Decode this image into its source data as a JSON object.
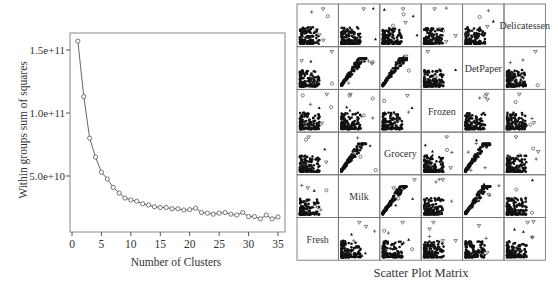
{
  "chart_data": [
    {
      "type": "line",
      "title": "",
      "xlabel": "Number of Clusters",
      "ylabel": "Within groups sum of squares",
      "xlim": [
        0,
        35
      ],
      "ylim": [
        12000000000.0,
        160000000000.0
      ],
      "x_ticks": [
        0,
        5,
        10,
        15,
        20,
        25,
        30,
        35
      ],
      "x_tick_labels": [
        "0",
        "5",
        "10",
        "15",
        "20",
        "25",
        "30",
        "35"
      ],
      "y_ticks": [
        50000000000.0,
        100000000000.0,
        150000000000.0
      ],
      "y_tick_labels": [
        "5.0e+10",
        "1.0e+11",
        "1.5e+11"
      ],
      "grid": false,
      "marker": "open-circle",
      "x": [
        1,
        2,
        3,
        4,
        5,
        6,
        7,
        8,
        9,
        10,
        11,
        12,
        13,
        14,
        15,
        16,
        17,
        18,
        19,
        20,
        21,
        22,
        23,
        24,
        25,
        26,
        27,
        28,
        29,
        30,
        31,
        32,
        33,
        34,
        35
      ],
      "y": [
        157000000000.0,
        113000000000.0,
        80000000000.0,
        65000000000.0,
        53000000000.0,
        47600000000.0,
        41000000000.0,
        36500000000.0,
        32500000000.0,
        31000000000.0,
        30000000000.0,
        27900000000.0,
        27000000000.0,
        25600000000.0,
        25000000000.0,
        25000000000.0,
        24000000000.0,
        24000000000.0,
        23000000000.0,
        23300000000.0,
        24500000000.0,
        21000000000.0,
        20500000000.0,
        19700000000.0,
        20500000000.0,
        21000000000.0,
        19700000000.0,
        19000000000.0,
        21000000000.0,
        17800000000.0,
        17800000000.0,
        16000000000.0,
        19000000000.0,
        16000000000.0,
        17500000000.0
      ]
    },
    {
      "type": "scatter",
      "title": "Scatter Plot Matrix",
      "variables_top_to_bottom": [
        "Delicatessen",
        "DetPaper",
        "Frozen",
        "Grocery",
        "Milk",
        "Fresh"
      ],
      "diagonal_labels": [
        "Fresh",
        "Milk",
        "Grocery",
        "Frozen",
        "DetPaper",
        "Delicatessen"
      ],
      "markers": [
        "filled-dot",
        "open-circle",
        "open-triangle-down",
        "plus",
        "filled-triangle"
      ],
      "cell_pattern": "dense cluster near origin with sparse outliers",
      "correlated_pairs": [
        [
          "Grocery",
          "DetPaper"
        ],
        [
          "Milk",
          "Grocery"
        ],
        [
          "Milk",
          "DetPaper"
        ]
      ]
    }
  ]
}
